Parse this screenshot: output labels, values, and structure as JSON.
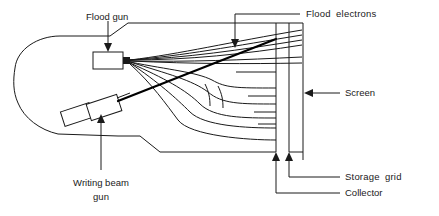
{
  "figure": {
    "stroke_color": "#1a1a1a",
    "background_color": "#ffffff"
  },
  "labels": {
    "flood_gun": "Flood gun",
    "flood_electrons": "Flood  electrons",
    "screen": "Screen",
    "storage_grid": "Storage  grid",
    "collector": "Collector",
    "writing_beam_line1": "Writing beam",
    "writing_beam_line2": "gun"
  },
  "components": [
    {
      "name": "flood-gun",
      "label": "Flood gun"
    },
    {
      "name": "writing-beam-gun",
      "label": "Writing beam gun"
    },
    {
      "name": "storage-grid",
      "label": "Storage  grid"
    },
    {
      "name": "collector",
      "label": "Collector"
    },
    {
      "name": "screen",
      "label": "Screen"
    },
    {
      "name": "flood-electrons",
      "label": "Flood  electrons"
    }
  ]
}
